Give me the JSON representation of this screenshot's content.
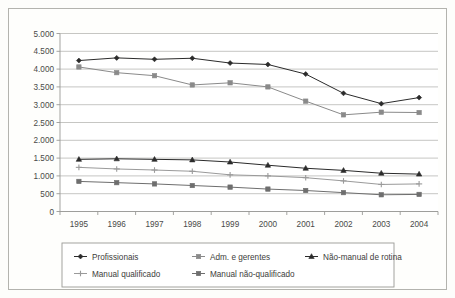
{
  "chart_data": {
    "type": "line",
    "title": "",
    "subtitle": "",
    "xlabel": "",
    "ylabel": "",
    "categories": [
      "1995",
      "1996",
      "1997",
      "1998",
      "1999",
      "2000",
      "2001",
      "2002",
      "2003",
      "2004"
    ],
    "ylim": [
      0,
      5000
    ],
    "ytick_values": [
      0,
      500,
      1000,
      1500,
      2000,
      2500,
      3000,
      3500,
      4000,
      4500,
      5000
    ],
    "ytick_labels": [
      "0",
      "500",
      "1.000",
      "1.500",
      "2.000",
      "2.500",
      "3.000",
      "3.500",
      "4.000",
      "4.500",
      "5.000"
    ],
    "grid": true,
    "grid_axis": "y",
    "legend_position": "bottom",
    "series": [
      {
        "name": "Profissionais",
        "marker": "diamond",
        "color": "#2b2b2b",
        "values": [
          4240,
          4315,
          4275,
          4305,
          4170,
          4130,
          3860,
          3320,
          3030,
          3200
        ]
      },
      {
        "name": "Adm. e gerentes",
        "marker": "square",
        "color": "#8a8a8a",
        "values": [
          4060,
          3900,
          3815,
          3555,
          3615,
          3500,
          3100,
          2715,
          2790,
          2780
        ]
      },
      {
        "name": "Não-manual de rotina",
        "marker": "triangle",
        "color": "#2b2b2b",
        "values": [
          1465,
          1480,
          1465,
          1450,
          1390,
          1300,
          1215,
          1155,
          1075,
          1050
        ]
      },
      {
        "name": "Manual qualificado",
        "marker": "cross",
        "color": "#9a9a9a",
        "values": [
          1240,
          1195,
          1165,
          1130,
          1030,
          1000,
          950,
          860,
          760,
          775
        ]
      },
      {
        "name": "Manual não-qualificado",
        "marker": "square",
        "color": "#6e6e6e",
        "values": [
          845,
          810,
          775,
          730,
          685,
          630,
          590,
          530,
          470,
          480
        ]
      }
    ]
  },
  "legend": {
    "entries": [
      {
        "label": "Profissionais"
      },
      {
        "label": "Adm. e gerentes"
      },
      {
        "label": "Não-manual de rotina"
      },
      {
        "label": "Manual qualificado"
      },
      {
        "label": "Manual não-qualificado"
      }
    ]
  }
}
